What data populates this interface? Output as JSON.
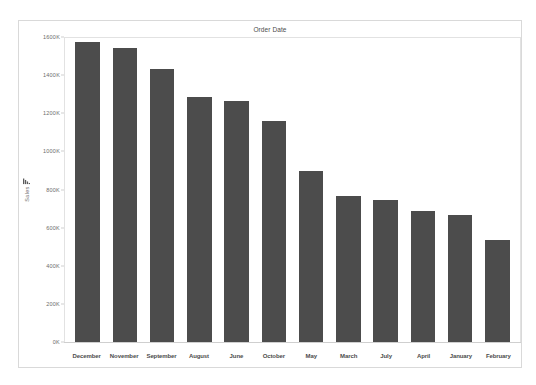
{
  "chart_data": {
    "type": "bar",
    "title": "Order Date",
    "xlabel": "",
    "ylabel": "Sales",
    "ylim": [
      0,
      1600000
    ],
    "grid": false,
    "legend": null,
    "y_ticks": [
      "0K",
      "200K",
      "400K",
      "600K",
      "800K",
      "1000K",
      "1200K",
      "1400K",
      "1600K"
    ],
    "y_tick_values": [
      0,
      200000,
      400000,
      600000,
      800000,
      1000000,
      1200000,
      1400000,
      1600000
    ],
    "categories": [
      "December",
      "November",
      "September",
      "August",
      "June",
      "October",
      "May",
      "March",
      "July",
      "April",
      "January",
      "February"
    ],
    "values": [
      1580000,
      1550000,
      1440000,
      1290000,
      1270000,
      1165000,
      900000,
      770000,
      750000,
      695000,
      670000,
      540000
    ],
    "bar_color": "#4c4c4c",
    "axis_color": "#cfcfcf",
    "text_color": "#4c4c4c"
  },
  "axis_icon": {
    "name": "bar-chart-icon"
  }
}
